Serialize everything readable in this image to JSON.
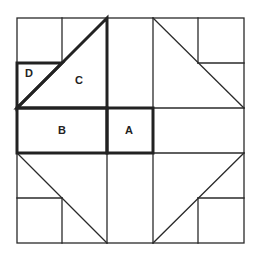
{
  "grid": {
    "x": [
      17,
      62,
      107,
      153,
      198,
      244
    ],
    "y": [
      18,
      63,
      108,
      153,
      198,
      243
    ]
  },
  "pieces": [
    {
      "id": "A",
      "label": "A",
      "x": 129,
      "y": 130
    },
    {
      "id": "B",
      "label": "B",
      "x": 62,
      "y": 130
    },
    {
      "id": "C",
      "label": "C",
      "x": 79,
      "y": 80
    },
    {
      "id": "D",
      "label": "D",
      "x": 29,
      "y": 73
    }
  ],
  "colors": {
    "line": "#2a2a2a",
    "background": "#ffffff"
  }
}
